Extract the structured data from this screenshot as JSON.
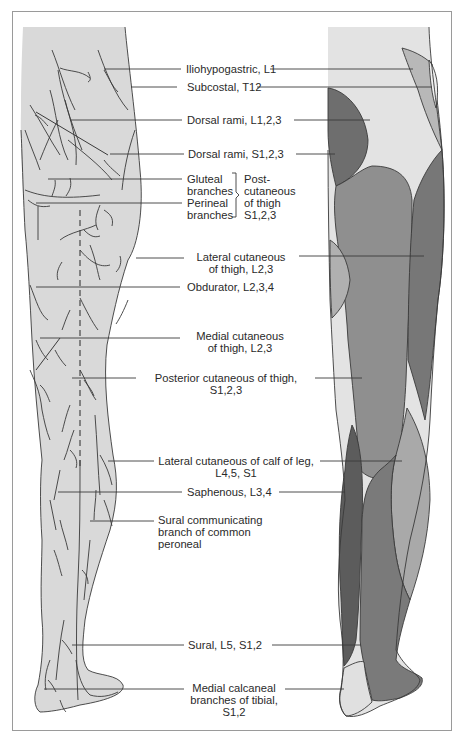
{
  "figure": {
    "colors": {
      "skin": "#d9d9d9",
      "outline": "#3a3a3a",
      "lightest": "#e6e6e6",
      "light": "#bdbdbd",
      "medium": "#9a9a9a",
      "dark": "#7d7d7d",
      "darkest": "#5f5f5f",
      "leader_line": "#3a3a3a"
    },
    "labels": {
      "iliohypogastric": "Iliohypogastric, L1",
      "subcostal": "Subcostal, T12",
      "dorsal_rami_l": "Dorsal rami, L1,2,3",
      "dorsal_rami_s": "Dorsal rami, S1,2,3",
      "gluteal_1": "Gluteal",
      "gluteal_2": "branches",
      "perineal_1": "Perineal",
      "perineal_2": "branches",
      "post_cut_1": "Post-",
      "post_cut_2": "cutaneous",
      "post_cut_3": "of thigh",
      "post_cut_4": "S1,2,3",
      "lat_cut_thigh_1": "Lateral cutaneous",
      "lat_cut_thigh_2": "of thigh, L2,3",
      "obdurator": "Obdurator, L2,3,4",
      "med_cut_thigh_1": "Medial cutaneous",
      "med_cut_thigh_2": "of thigh, L2,3",
      "post_cut_thigh_1": "Posterior cutaneous of thigh,",
      "post_cut_thigh_2": "S1,2,3",
      "lat_cut_calf_1": "Lateral cutaneous of calf of leg,",
      "lat_cut_calf_2": "L4,5, S1",
      "saphenous": "Saphenous, L3,4",
      "sural_comm_1": "Sural communicating",
      "sural_comm_2": "branch of common",
      "sural_comm_3": "peroneal",
      "sural": "Sural, L5, S1,2",
      "med_calc_1": "Medial calcaneal",
      "med_calc_2": "branches of tibial,",
      "med_calc_3": "S1,2"
    }
  }
}
